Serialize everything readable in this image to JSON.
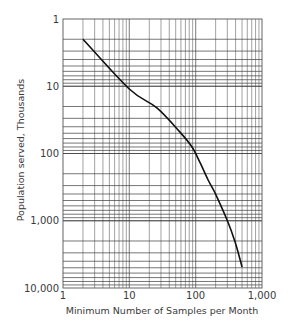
{
  "chart_data": {
    "type": "line",
    "title": "",
    "xlabel": "Minimum Number of Samples per Month",
    "ylabel": "Population served, Thousands",
    "xscale": "log",
    "yscale": "log",
    "y_inverted": true,
    "xlim": [
      1,
      1000
    ],
    "ylim": [
      1,
      10000
    ],
    "grid": true,
    "x_ticks": [
      1,
      10,
      100,
      1000
    ],
    "x_tick_labels": [
      "1",
      "10",
      "100",
      "1,000"
    ],
    "y_ticks": [
      1,
      10,
      100,
      1000,
      10000
    ],
    "y_tick_labels": [
      "1",
      "10",
      "100",
      "1,000",
      "10,000"
    ],
    "series": [
      {
        "name": "Minimum samples vs population",
        "x": [
          2,
          10,
          26,
          58,
          88,
          117,
          154,
          196,
          298,
          393,
          501
        ],
        "y": [
          2,
          11,
          21,
          48,
          80,
          138,
          248,
          387,
          975,
          2070,
          4870
        ]
      }
    ]
  }
}
